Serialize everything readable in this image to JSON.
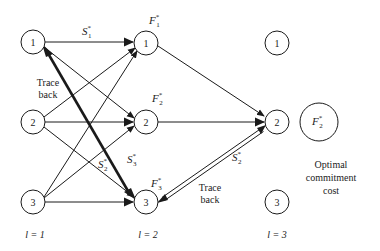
{
  "diagram": {
    "type": "dynamic-programming-stage-graph",
    "stages": [
      {
        "label": "l = 1",
        "nodes": [
          "1",
          "2",
          "3"
        ]
      },
      {
        "label": "l = 2",
        "nodes": [
          "1",
          "2",
          "3"
        ]
      },
      {
        "label": "l = 3",
        "nodes": [
          "1",
          "2",
          "3"
        ]
      }
    ],
    "stage_labels": {
      "s1": "l = 1",
      "s2": "l = 2",
      "s3": "l = 3"
    },
    "node_labels": {
      "s1n1": "1",
      "s1n2": "2",
      "s1n3": "3",
      "s2n1": "1",
      "s2n2": "2",
      "s2n3": "3",
      "s3n1": "1",
      "s3n2": "2",
      "s3n3": "3"
    },
    "cost_labels": {
      "F1": {
        "base": "F",
        "sup": "*",
        "sub": "1"
      },
      "F2": {
        "base": "F",
        "sup": "*",
        "sub": "2"
      },
      "F3": {
        "base": "F",
        "sup": "*",
        "sub": "3"
      },
      "F2_final": {
        "base": "F",
        "sup": "*",
        "sub": "2"
      }
    },
    "state_labels": {
      "S1": {
        "base": "S",
        "sup": "*",
        "sub": "1"
      },
      "S2_stage1": {
        "base": "S",
        "sup": "*",
        "sub": "2"
      },
      "S3": {
        "base": "S",
        "sup": "*",
        "sub": "3"
      },
      "S2_stage2": {
        "base": "S",
        "sup": "*",
        "sub": "2"
      }
    },
    "annotations": {
      "trace_back_1_line1": "Trace",
      "trace_back_1_line2": "back",
      "trace_back_2_line1": "Trace",
      "trace_back_2_line2": "back",
      "optimal_line1": "Optimal",
      "optimal_line2": "commitment",
      "optimal_line3": "cost"
    },
    "edges": [
      {
        "from": "s1n1",
        "to": "s2n1"
      },
      {
        "from": "s1n1",
        "to": "s2n2"
      },
      {
        "from": "s1n1",
        "to": "s2n3",
        "style": "thick-bidirectional",
        "note": "trace back"
      },
      {
        "from": "s1n2",
        "to": "s2n1"
      },
      {
        "from": "s1n2",
        "to": "s2n2"
      },
      {
        "from": "s1n2",
        "to": "s2n3"
      },
      {
        "from": "s1n3",
        "to": "s2n1"
      },
      {
        "from": "s1n3",
        "to": "s2n2"
      },
      {
        "from": "s1n3",
        "to": "s2n3"
      },
      {
        "from": "s2n1",
        "to": "s3n2"
      },
      {
        "from": "s2n2",
        "to": "s3n2"
      },
      {
        "from": "s2n3",
        "to": "s3n2",
        "style": "double-line-bidirectional",
        "note": "trace back"
      }
    ],
    "colors": {
      "stroke": "#1a1a1a",
      "background": "#ffffff"
    }
  }
}
